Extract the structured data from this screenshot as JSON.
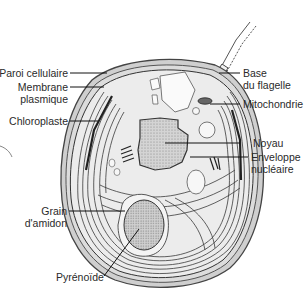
{
  "diagram": {
    "labels": {
      "paroi_cellulaire": "Paroi cellulaire",
      "membrane_plasmique_1": "Membrane",
      "membrane_plasmique_2": "plasmique",
      "chloroplaste": "Chloroplaste",
      "base_flagelle_1": "Base",
      "base_flagelle_2": "du flagelle",
      "mitochondrie": "Mitochondrie",
      "noyau": "Noyau",
      "enveloppe_nucleaire_1": "Enveloppe",
      "enveloppe_nucleaire_2": "nucléaire",
      "grain_amidon_1": "Grain",
      "grain_amidon_2": "d'amidon",
      "pyrenoide": "Pyrénoïde"
    },
    "colors": {
      "wall": "#555555",
      "cytoplasm": "#e6e6e6",
      "nucleus": "#c8c8c8",
      "pyrenoid": "#cfcfcf",
      "chloroplast_lines": "#3a3a3a",
      "label_text": "#2a2a2a"
    }
  }
}
